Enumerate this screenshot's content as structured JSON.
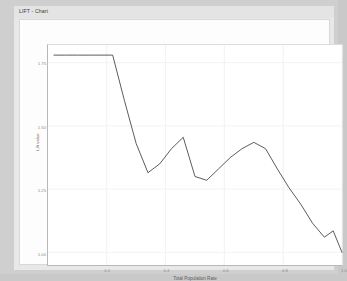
{
  "window": {
    "title": "LIFT - Chart"
  },
  "chart_data": {
    "type": "line",
    "title": "LIFT - Chart",
    "xlabel": "Total Population Rate",
    "ylabel": "Lift value",
    "grid": true,
    "legend": "none",
    "line_color": "#4a4a4a",
    "background_color": "#ffffff",
    "xlim": [
      0.0,
      1.0
    ],
    "ylim": [
      0.95,
      1.82
    ],
    "xticks": [
      0.2,
      0.4,
      0.6,
      0.8,
      1.0
    ],
    "xtick_labels": [
      "0.2",
      "0.4",
      "0.6",
      "0.8",
      "1.0"
    ],
    "yticks": [
      1.75,
      1.5,
      1.25,
      1.0
    ],
    "ytick_labels": [
      "1.75",
      "1.50",
      "1.25",
      "1.00"
    ],
    "series": [
      {
        "name": "Lift",
        "x": [
          0.02,
          0.06,
          0.1,
          0.14,
          0.18,
          0.22,
          0.26,
          0.3,
          0.34,
          0.38,
          0.42,
          0.46,
          0.5,
          0.54,
          0.58,
          0.62,
          0.66,
          0.7,
          0.74,
          0.78,
          0.82,
          0.86,
          0.9,
          0.94,
          0.97,
          1.0
        ],
        "y": [
          1.78,
          1.78,
          1.78,
          1.78,
          1.78,
          1.78,
          1.6,
          1.43,
          1.315,
          1.35,
          1.41,
          1.455,
          1.3,
          1.285,
          1.33,
          1.375,
          1.41,
          1.435,
          1.41,
          1.33,
          1.255,
          1.19,
          1.115,
          1.06,
          1.085,
          1.0
        ]
      }
    ]
  }
}
